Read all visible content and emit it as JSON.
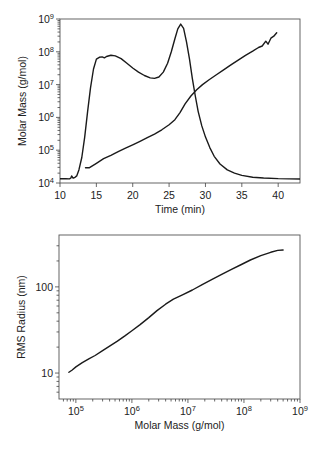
{
  "chart_data": [
    {
      "type": "line",
      "title": "",
      "xlabel": "Time (min)",
      "ylabel": "Molar Mass (g/mol)",
      "xscale": "linear",
      "yscale": "log",
      "xlim": [
        10,
        43
      ],
      "ylim": [
        10000,
        1000000000
      ],
      "xticks": [
        10,
        15,
        20,
        25,
        30,
        35,
        40
      ],
      "xtick_labels": [
        "10",
        "15",
        "20",
        "25",
        "30",
        "35",
        "40"
      ],
      "yticks": [
        10000,
        100000,
        1000000,
        10000000,
        100000000,
        1000000000
      ],
      "ytick_labels": [
        [
          "10",
          "4"
        ],
        [
          "10",
          "5"
        ],
        [
          "10",
          "6"
        ],
        [
          "10",
          "7"
        ],
        [
          "10",
          "8"
        ],
        [
          "10",
          "9"
        ]
      ],
      "grid": false,
      "legend": null,
      "series": [
        {
          "name": "Detector signal (elution profile)",
          "x": [
            10,
            10.8,
            11.3,
            11.5,
            11.6,
            11.8,
            12.0,
            12.3,
            12.6,
            13.0,
            13.4,
            13.8,
            14.2,
            14.6,
            15.0,
            15.4,
            15.8,
            16.1,
            16.4,
            17.0,
            17.6,
            18.4,
            19.2,
            20.0,
            20.8,
            21.6,
            22.4,
            23.0,
            23.6,
            24.2,
            24.8,
            25.3,
            25.8,
            26.2,
            26.6,
            27.0,
            27.4,
            27.8,
            28.2,
            28.6,
            29.0,
            29.5,
            30.0,
            30.6,
            31.2,
            32.0,
            33.0,
            34.0,
            35.0,
            36.5,
            38.0,
            40.0,
            43.0
          ],
          "y": [
            13500,
            13500,
            13300,
            14200,
            16500,
            14000,
            14500,
            16500,
            25000,
            60000,
            250000,
            1500000,
            8000000,
            30000000,
            60000000,
            68000000,
            70000000,
            65000000,
            72000000,
            78000000,
            75000000,
            62000000,
            45000000,
            32000000,
            24000000,
            19000000,
            16000000,
            15500000,
            17000000,
            24000000,
            45000000,
            100000000,
            250000000,
            500000000,
            700000000,
            520000000,
            200000000,
            60000000,
            15000000,
            4500000,
            1500000,
            550000,
            250000,
            120000,
            65000,
            38000,
            25000,
            20000,
            17000,
            15000,
            14200,
            13600,
            13200
          ]
        },
        {
          "name": "Molar mass",
          "x": [
            13.5,
            14.0,
            15.0,
            16.0,
            17.0,
            18.0,
            19.0,
            20.0,
            21.0,
            22.0,
            23.0,
            24.0,
            25.0,
            25.8,
            26.5,
            27.2,
            28.0,
            28.8,
            29.6,
            30.5,
            31.5,
            32.5,
            33.5,
            34.5,
            35.5,
            36.5,
            37.3,
            37.8,
            38.3,
            38.6,
            39.0,
            39.4,
            39.8
          ],
          "y": [
            29000,
            29000,
            40000,
            55000,
            70000,
            90000,
            115000,
            145000,
            185000,
            240000,
            310000,
            420000,
            600000,
            850000,
            1400000,
            2600000,
            4500000,
            7000000,
            10000000,
            14000000,
            20000000,
            28000000,
            40000000,
            56000000,
            78000000,
            105000000,
            135000000,
            150000000,
            210000000,
            170000000,
            260000000,
            300000000,
            380000000
          ]
        }
      ]
    },
    {
      "type": "line",
      "title": "",
      "xlabel": "Molar Mass (g/mol)",
      "ylabel": "RMS Radius (nm)",
      "xscale": "log",
      "yscale": "log",
      "xlim": [
        50000,
        1000000000
      ],
      "ylim": [
        5,
        400
      ],
      "xticks": [
        100000,
        1000000,
        10000000,
        100000000,
        1000000000
      ],
      "xtick_labels": [
        [
          "10",
          "5"
        ],
        [
          "10",
          "6"
        ],
        [
          "10",
          "7"
        ],
        [
          "10",
          "8"
        ],
        [
          "10",
          "9"
        ]
      ],
      "yticks": [
        10,
        100
      ],
      "ytick_labels": [
        "10",
        "100"
      ],
      "grid": false,
      "legend": null,
      "series": [
        {
          "name": "RMS radius vs molar mass",
          "x": [
            75000,
            85000,
            100000,
            130000,
            170000,
            220000,
            300000,
            400000,
            550000,
            750000,
            1000000,
            1400000,
            2000000,
            2800000,
            4000000,
            5500000,
            8000000,
            12000000,
            18000000,
            27000000,
            40000000,
            60000000,
            90000000,
            130000000,
            200000000,
            300000000,
            400000000,
            500000000
          ],
          "y": [
            10.2,
            10.8,
            11.8,
            13.2,
            14.6,
            16.0,
            18.2,
            20.5,
            23.5,
            27.0,
            31.0,
            36.5,
            44.0,
            53.0,
            63.0,
            72.0,
            81.0,
            92.0,
            106.0,
            122.0,
            140.0,
            160.0,
            182.0,
            205.0,
            230.0,
            252.0,
            265.0,
            268.0
          ]
        }
      ]
    }
  ]
}
